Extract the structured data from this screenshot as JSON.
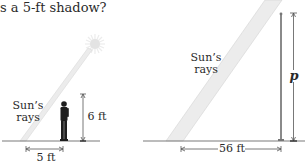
{
  "question_fragment": "s a 5-ft shadow?",
  "left_figure": {
    "rays_label_line1": "Sun’s",
    "rays_label_line2": "rays",
    "height_label": "6 ft",
    "shadow_label": "5 ft"
  },
  "right_figure": {
    "rays_label_line1": "Sun’s",
    "rays_label_line2": "rays",
    "height_label": "p",
    "shadow_label": "56 ft"
  },
  "colors": {
    "text": "#2a2a2a",
    "ground": "#7a7a7a",
    "ray_fill": "#ececec",
    "ray_edge": "#d4d4d4",
    "sun": "#e6e6e6",
    "person": "#1e1e1e",
    "pole": "#8a8a8a"
  }
}
